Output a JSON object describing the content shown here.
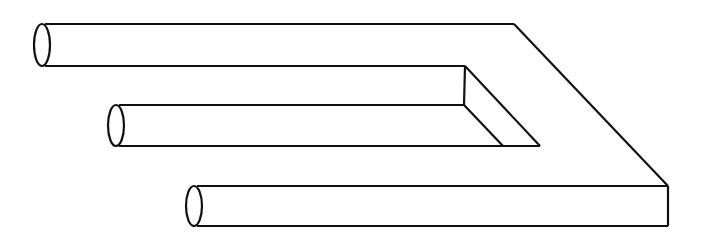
{
  "figure": {
    "stroke_color": "#111111",
    "background": "#ffffff",
    "prongs": [
      {
        "name": "top-prong",
        "ellipse_cx": 41,
        "top_y": 24,
        "bottom_y": 66
      },
      {
        "name": "middle-prong",
        "ellipse_cx": 115,
        "top_y": 105,
        "bottom_y": 146
      },
      {
        "name": "bottom-prong",
        "ellipse_cx": 194,
        "top_y": 186,
        "bottom_y": 226
      }
    ]
  }
}
